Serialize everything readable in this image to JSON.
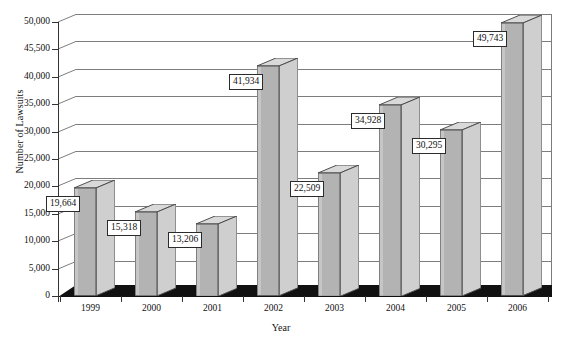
{
  "chart_data": {
    "type": "bar",
    "title": "",
    "xlabel": "Year",
    "ylabel": "Number of Lawsuits",
    "categories": [
      "1999",
      "2000",
      "2001",
      "2002",
      "2003",
      "2004",
      "2005",
      "2006"
    ],
    "values": [
      19664,
      15318,
      13206,
      41934,
      22509,
      34928,
      30295,
      49743
    ],
    "value_labels": [
      "19,664",
      "15,318",
      "13,206",
      "41,934",
      "22,509",
      "34,928",
      "30,295",
      "49,743"
    ],
    "ylim": [
      0,
      50000
    ],
    "ytick_values": [
      0,
      5000,
      10000,
      15000,
      20000,
      25000,
      30000,
      35000,
      40000,
      45500,
      50000
    ],
    "ytick_labels": [
      "0",
      "5,000",
      "10,000",
      "15,000",
      "20,000",
      "25,000",
      "30,000",
      "35,000",
      "40,000",
      "45,500",
      "50,000"
    ],
    "grid": true,
    "legend": false,
    "style": "3d-column",
    "colors": {
      "bar_front": "#b3b3b3",
      "bar_side": "#cfcfcf",
      "bar_top": "#d9d9d9",
      "bar_outline": "#4d4d4d",
      "gridline": "#7d7d7d",
      "axis": "#333333",
      "floor": "#111111",
      "label_background": "#ffffff",
      "label_border": "#2b2b2b",
      "text": "#111111"
    }
  }
}
